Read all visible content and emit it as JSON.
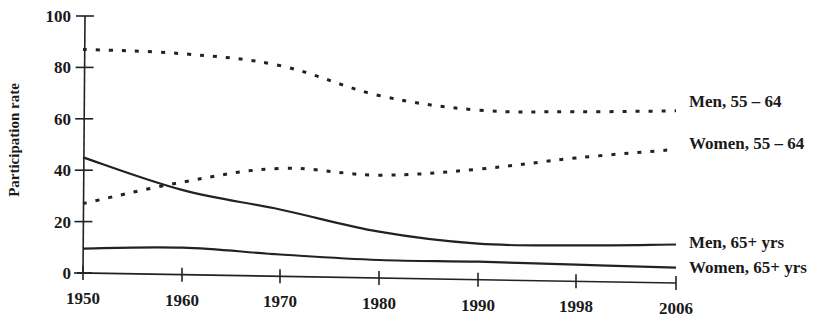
{
  "chart_data": {
    "type": "line",
    "title": "",
    "xlabel": "",
    "ylabel": "Participation rate",
    "ylim": [
      0,
      100
    ],
    "yticks": [
      0,
      20,
      40,
      60,
      80,
      100
    ],
    "categories": [
      "1950",
      "1960",
      "1970",
      "1980",
      "1990",
      "1998",
      "2006"
    ],
    "grid": false,
    "legend_position": "right, inline labels at line ends",
    "series": [
      {
        "name": "Men, 55 – 64",
        "style": "dotted",
        "values": [
          87,
          86,
          82,
          71,
          66,
          66,
          67
        ]
      },
      {
        "name": "Women, 55 – 64",
        "style": "dotted",
        "values": [
          27,
          36,
          42,
          40,
          43,
          48,
          52
        ]
      },
      {
        "name": "Men, 65+ yrs",
        "style": "solid",
        "values": [
          45,
          33,
          26,
          18,
          14,
          14,
          15
        ]
      },
      {
        "name": "Women, 65+ yrs",
        "style": "solid",
        "values": [
          9.5,
          10.5,
          8.5,
          7,
          7,
          6.5,
          6
        ]
      }
    ]
  },
  "colors": {
    "ink": "#222222",
    "background": "#ffffff"
  }
}
